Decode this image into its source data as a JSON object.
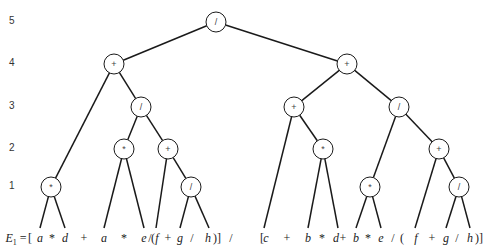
{
  "diagram": {
    "type": "expression-tree",
    "level_labels": [
      "5",
      "4",
      "3",
      "2",
      "1"
    ],
    "expression_label": "E",
    "expression_subscript": "1",
    "expression_equals": "=",
    "nodes": [
      {
        "id": "root",
        "op": "/",
        "level": 5
      },
      {
        "id": "L4a",
        "op": "+",
        "level": 4
      },
      {
        "id": "L4b",
        "op": "+",
        "level": 4
      },
      {
        "id": "L3a",
        "op": "/",
        "level": 3
      },
      {
        "id": "L3b",
        "op": "+",
        "level": 3
      },
      {
        "id": "L3c",
        "op": "/",
        "level": 3
      },
      {
        "id": "L2a",
        "op": "*",
        "level": 2
      },
      {
        "id": "L2b",
        "op": "+",
        "level": 2
      },
      {
        "id": "L2c",
        "op": "*",
        "level": 2
      },
      {
        "id": "L2d",
        "op": "+",
        "level": 2
      },
      {
        "id": "L1a",
        "op": "*",
        "level": 1
      },
      {
        "id": "L1b",
        "op": "/",
        "level": 1
      },
      {
        "id": "L1c",
        "op": "*",
        "level": 1
      },
      {
        "id": "L1d",
        "op": "/",
        "level": 1
      }
    ],
    "edges": [
      [
        "root",
        "L4a"
      ],
      [
        "root",
        "L4b"
      ],
      [
        "L4a",
        "L1a"
      ],
      [
        "L4a",
        "L3a"
      ],
      [
        "L3a",
        "L2a"
      ],
      [
        "L3a",
        "L2b"
      ],
      [
        "L1a",
        "leaf0"
      ],
      [
        "L1a",
        "leaf1"
      ],
      [
        "L2a",
        "leaf2"
      ],
      [
        "L2a",
        "leaf3"
      ],
      [
        "L2b",
        "leaf4"
      ],
      [
        "L2b",
        "L1b"
      ],
      [
        "L1b",
        "leaf5"
      ],
      [
        "L1b",
        "leaf6"
      ],
      [
        "L4b",
        "L3b"
      ],
      [
        "L4b",
        "L3c"
      ],
      [
        "L3b",
        "leaf7"
      ],
      [
        "L3b",
        "L2c"
      ],
      [
        "L2c",
        "leaf8"
      ],
      [
        "L2c",
        "leaf9"
      ],
      [
        "L3c",
        "L1c"
      ],
      [
        "L3c",
        "L2d"
      ],
      [
        "L1c",
        "leaf10"
      ],
      [
        "L1c",
        "leaf11"
      ],
      [
        "L2d",
        "leaf12"
      ],
      [
        "L2d",
        "L1d"
      ],
      [
        "L1d",
        "leaf13"
      ],
      [
        "L1d",
        "leaf14"
      ]
    ],
    "leaves": [
      "a",
      "d",
      "a",
      "e",
      "f",
      "g",
      "h",
      "c",
      "b",
      "d",
      "b",
      "e",
      "f",
      "g",
      "h"
    ],
    "expression_tokens": [
      {
        "t": "[",
        "op": true
      },
      {
        "t": "a"
      },
      {
        "t": "*",
        "op": true
      },
      {
        "t": "d"
      },
      {
        "t": "+",
        "op": true
      },
      {
        "t": "a"
      },
      {
        "t": "*",
        "op": true
      },
      {
        "t": "e"
      },
      {
        "t": "/",
        "op": true
      },
      {
        "t": "(",
        "op": true
      },
      {
        "t": "f"
      },
      {
        "t": "+",
        "op": true
      },
      {
        "t": "g"
      },
      {
        "t": "/",
        "op": true
      },
      {
        "t": "h"
      },
      {
        "t": ")]",
        "op": true
      },
      {
        "t": "/",
        "op": true
      },
      {
        "t": "[",
        "op": true
      },
      {
        "t": "c"
      },
      {
        "t": "+",
        "op": true
      },
      {
        "t": "b"
      },
      {
        "t": "*",
        "op": true
      },
      {
        "t": "d"
      },
      {
        "t": "+",
        "op": true
      },
      {
        "t": "b"
      },
      {
        "t": "*",
        "op": true
      },
      {
        "t": "e"
      },
      {
        "t": "/",
        "op": true
      },
      {
        "t": "(",
        "op": true
      },
      {
        "t": "f"
      },
      {
        "t": "+",
        "op": true
      },
      {
        "t": "g"
      },
      {
        "t": "/",
        "op": true
      },
      {
        "t": "h"
      },
      {
        "t": ")]",
        "op": true
      }
    ]
  }
}
